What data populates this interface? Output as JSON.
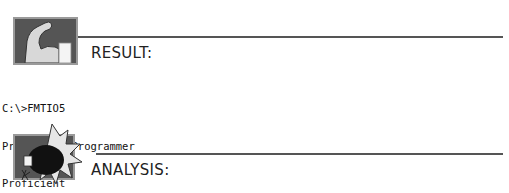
{
  "result_section": {
    "heading": "RESULT:",
    "icon": "flexed-arm-icon"
  },
  "console_output": {
    "lines": [
      "C:\\>FMTIO5",
      "Proficient Programmer",
      "Proficient"
    ]
  },
  "analysis_section": {
    "heading": "ANALYSIS:",
    "icon": "boxing-glove-icon"
  },
  "colors": {
    "icon_background": "#555555",
    "icon_border": "#9a9a9a",
    "rule": "#555555",
    "text": "#222222"
  }
}
